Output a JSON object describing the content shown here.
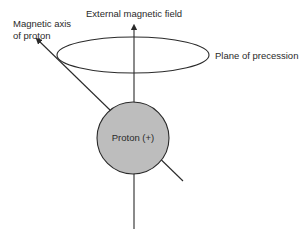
{
  "diagram": {
    "labels": {
      "external_field": "External magnetic field",
      "magnetic_axis_line1": "Magnetic axis",
      "magnetic_axis_line2": "of proton",
      "plane": "Plane of precession",
      "proton": "Proton (+)"
    },
    "colors": {
      "stroke": "#2a2a2a",
      "proton_fill": "#bdbdbd",
      "background": "#ffffff"
    }
  }
}
